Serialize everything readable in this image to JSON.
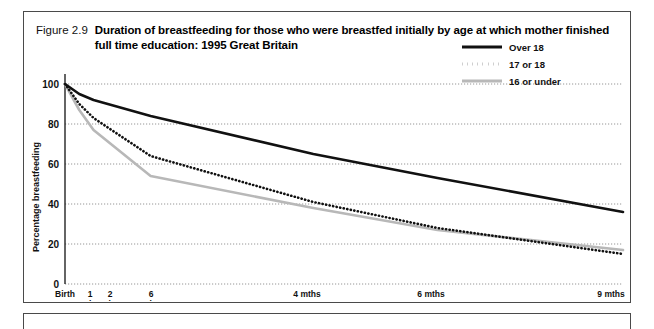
{
  "figure": {
    "number": "Figure 2.9",
    "title": "Duration of breastfeeding for those who were breastfed initially by age at which mother finished full time education: 1995 Great Britain"
  },
  "chart_data": {
    "type": "line",
    "title": "Duration of breastfeeding for those who were breastfed initially by age at which mother finished full time education: 1995 Great Britain",
    "xlabel": "Age of baby",
    "ylabel": "Percentage breastfeeding",
    "categories": [
      "Birth",
      "1 wk",
      "2 wks",
      "6 wks",
      "4 mths",
      "6 mths",
      "9 mths"
    ],
    "x_positions": [
      0,
      1,
      2,
      6,
      17.4,
      26.1,
      39.1
    ],
    "xlim": [
      0,
      39.1
    ],
    "ylim": [
      0,
      110
    ],
    "yticks": [
      0,
      20,
      40,
      60,
      80,
      100
    ],
    "grid": "horizontal-dotted",
    "legend_position": "top-right",
    "series": [
      {
        "name": "Over 18",
        "style": "solid",
        "color": "#111111",
        "values": [
          100,
          95,
          92,
          84,
          65,
          53,
          36
        ]
      },
      {
        "name": "17 or 18",
        "style": "dotted",
        "color": "#111111",
        "values": [
          100,
          90,
          83,
          64,
          41,
          28,
          15
        ]
      },
      {
        "name": "16 or under",
        "style": "solid",
        "color": "#b8b8b8",
        "values": [
          100,
          87,
          77,
          54,
          38,
          27,
          17
        ]
      }
    ]
  },
  "axes": {
    "y_ticks": [
      "0",
      "20",
      "40",
      "60",
      "80",
      "100"
    ],
    "y_title": "Percentage breastfeeding",
    "x_title": "Age of baby",
    "x_ticks": [
      {
        "line1": "Birth",
        "line2": ""
      },
      {
        "line1": "1",
        "line2": "wk"
      },
      {
        "line1": "2",
        "line2": "wks"
      },
      {
        "line1": "6",
        "line2": "wks"
      },
      {
        "line1": "4 mths",
        "line2": ""
      },
      {
        "line1": "6 mths",
        "line2": ""
      },
      {
        "line1": "9 mths",
        "line2": ""
      }
    ]
  },
  "legend": {
    "items": [
      {
        "label": "Over 18",
        "style": "solid",
        "color": "#111111"
      },
      {
        "label": "17 or 18",
        "style": "dotted",
        "color": "#111111"
      },
      {
        "label": "16 or under",
        "style": "solid",
        "color": "#b8b8b8"
      }
    ]
  }
}
